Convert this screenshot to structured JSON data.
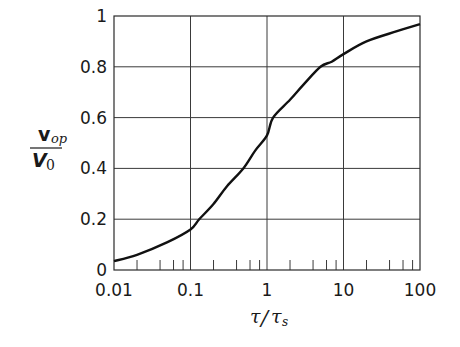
{
  "chart_data": {
    "type": "line",
    "title": "",
    "xlabel": "τ/τs",
    "ylabel": "v_op / V_0",
    "xscale": "log",
    "xlim": [
      0.01,
      100
    ],
    "ylim": [
      0,
      1
    ],
    "grid": true,
    "legend": null,
    "x_ticks": [
      "0.01",
      "0.1",
      "1",
      "10",
      "100"
    ],
    "y_ticks": [
      "0",
      "0.2",
      "0.4",
      "0.6",
      "0.8",
      "1"
    ],
    "series": [
      {
        "name": "v_op/V_0",
        "x": [
          0.01,
          0.02,
          0.05,
          0.1,
          0.13,
          0.2,
          0.3,
          0.49,
          0.7,
          1,
          1.2,
          2,
          3,
          5,
          7,
          10,
          20,
          50,
          100
        ],
        "y": [
          0.035,
          0.06,
          0.11,
          0.16,
          0.2,
          0.26,
          0.33,
          0.4,
          0.47,
          0.53,
          0.6,
          0.67,
          0.73,
          0.8,
          0.82,
          0.85,
          0.9,
          0.94,
          0.968
        ]
      }
    ]
  },
  "axes": {
    "ylabel_top": "v",
    "ylabel_top_sub": "op",
    "ylabel_bottom": "V",
    "ylabel_bottom_sub": "0",
    "xlabel_main": "τ",
    "xlabel_slash": "/",
    "xlabel_denom": "τ",
    "xlabel_denom_sub": "s"
  }
}
